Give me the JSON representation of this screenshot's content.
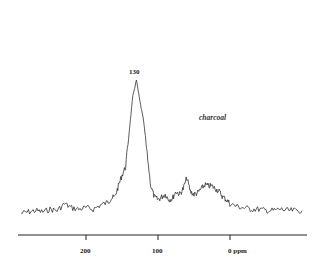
{
  "chart_data": {
    "type": "line",
    "title": "",
    "subtitle": "",
    "xlabel": "ppm",
    "ylabel": "",
    "x_reversed": true,
    "xlim": [
      290,
      -100
    ],
    "x_ticks": [
      200,
      100,
      0
    ],
    "x_tick_labels": [
      "200",
      "100",
      "0 ppm"
    ],
    "grid": false,
    "legend": null,
    "annotations": [
      {
        "text": "130",
        "x": 130,
        "role": "peak-label"
      },
      {
        "text": "charcoal",
        "role": "sample-label"
      }
    ],
    "series": [
      {
        "name": "charcoal",
        "x": [
          290,
          280,
          270,
          260,
          250,
          240,
          230,
          220,
          210,
          200,
          190,
          180,
          170,
          165,
          160,
          155,
          150,
          145,
          140,
          135,
          130,
          125,
          120,
          115,
          110,
          105,
          100,
          95,
          90,
          85,
          80,
          75,
          70,
          65,
          60,
          55,
          50,
          45,
          40,
          35,
          30,
          25,
          20,
          15,
          10,
          5,
          0,
          -10,
          -20,
          -30,
          -40,
          -50,
          -60,
          -70,
          -80,
          -90,
          -100
        ],
        "y": [
          2,
          3,
          4,
          3,
          5,
          4,
          9,
          6,
          5,
          6,
          5,
          8,
          10,
          13,
          14,
          22,
          30,
          36,
          62,
          88,
          100,
          84,
          70,
          45,
          22,
          14,
          12,
          14,
          16,
          12,
          13,
          18,
          16,
          20,
          28,
          18,
          16,
          17,
          20,
          23,
          22,
          22,
          20,
          18,
          14,
          12,
          9,
          7,
          6,
          5,
          5,
          4,
          4,
          5,
          4,
          4,
          4
        ]
      }
    ]
  },
  "labels": {
    "peak": "130",
    "sample": "charcoal",
    "tick_200": "200",
    "tick_100": "100",
    "tick_0": "0 ppm"
  }
}
